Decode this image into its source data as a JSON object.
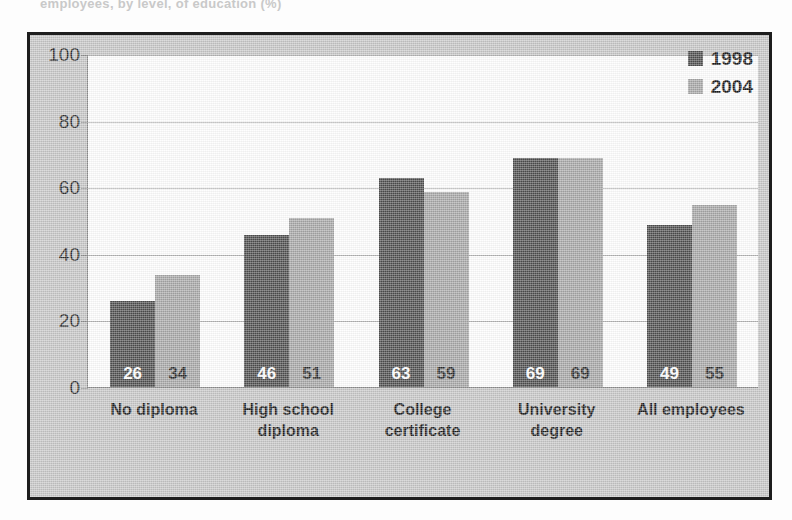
{
  "page": {
    "top_cut_text": "employees, by level, of education (%)"
  },
  "chart_data": {
    "type": "bar",
    "title": "",
    "subtitle": "",
    "xlabel": "",
    "ylabel": "",
    "ylim": [
      0,
      100
    ],
    "yticks": [
      0,
      20,
      40,
      60,
      80,
      100
    ],
    "grid": true,
    "legend_position": "top-right",
    "categories": [
      "No diploma",
      "High school diploma",
      "College certificate",
      "University degree",
      "All employees"
    ],
    "category_lines": [
      [
        "No diploma"
      ],
      [
        "High school",
        "diploma"
      ],
      [
        "College",
        "certificate"
      ],
      [
        "University",
        "degree"
      ],
      [
        "All employees"
      ]
    ],
    "series": [
      {
        "name": "1998",
        "color": "#4d4d4d",
        "values": [
          26,
          46,
          63,
          69,
          49
        ]
      },
      {
        "name": "2004",
        "color": "#a6a6a6",
        "values": [
          34,
          51,
          59,
          69,
          55
        ]
      }
    ]
  },
  "colors": {
    "series_1998": "#4d4d4d",
    "series_2004": "#a6a6a6",
    "frame_border": "#1d1d1d",
    "plate_background": "#c6c6c6",
    "plot_background": "#fefefe",
    "gridline": "#b4b4b4",
    "text": "#1a1a1a"
  }
}
